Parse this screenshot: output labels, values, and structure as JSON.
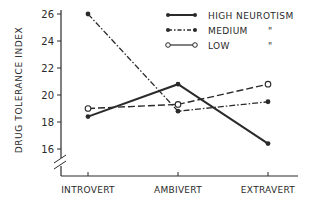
{
  "chart_data": {
    "type": "line",
    "title": "",
    "xlabel": "",
    "ylabel": "DRUG TOLERANCE INDEX",
    "categories": [
      "INTROVERT",
      "AMBIVERT",
      "EXTRAVERT"
    ],
    "yticks": [
      16,
      18,
      20,
      22,
      24,
      26
    ],
    "ylim": [
      15,
      26
    ],
    "grid": false,
    "axis_break": true,
    "legend_position": "top-right",
    "series": [
      {
        "name": "HIGH NEUROTISM",
        "style": "solid",
        "marker": "filled-dot",
        "values": [
          18.4,
          20.8,
          16.4
        ]
      },
      {
        "name": "MEDIUM",
        "style": "dash-dot",
        "marker": "filled-dot",
        "values": [
          26.0,
          18.8,
          19.5
        ]
      },
      {
        "name": "LOW",
        "style": "dashed",
        "marker": "open-circle",
        "values": [
          19.0,
          19.3,
          20.8
        ]
      }
    ],
    "legend": [
      {
        "label": "HIGH NEUROTISM",
        "ditto": ""
      },
      {
        "label": "MEDIUM",
        "ditto": "\""
      },
      {
        "label": "LOW",
        "ditto": "\""
      }
    ],
    "colors": {
      "ink": "#2a2a2a",
      "background": "#ffffff"
    }
  }
}
